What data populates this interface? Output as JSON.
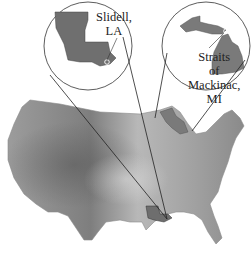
{
  "figure": {
    "type": "elevation map with inset callouts",
    "base_map": "Contiguous United States (grayscale shaded relief)"
  },
  "insets": [
    {
      "id": "louisiana",
      "state": "Louisiana",
      "label_line1": "Slidell,",
      "label_line2": "LA",
      "marker": "circle near southeast Louisiana"
    },
    {
      "id": "michigan",
      "state": "Michigan",
      "label_line1": "Straits",
      "label_line2": "of",
      "label_line3": "Mackinac,",
      "label_line4": "MI",
      "marker": "circle at the Straits of Mackinac"
    }
  ],
  "colors": {
    "background": "#ffffff",
    "map_light": "#c8c8c8",
    "map_mid": "#9a9a9a",
    "map_dark": "#6e6e6e",
    "inset_fill": "#7a7a7a",
    "line": "#222222"
  }
}
